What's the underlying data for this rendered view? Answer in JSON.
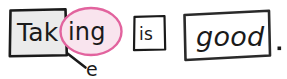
{
  "canvas": {
    "width": 287,
    "height": 78,
    "background": "#ffffff",
    "ink_color": "#1a1a1a"
  },
  "sentence": {
    "full_text": "Taking is good.",
    "terminal_punctuation": "."
  },
  "boxes": [
    {
      "id": "stem-box",
      "name": "verb-stem-box",
      "text": "Tak",
      "fill": "#ebebeb",
      "stroke": "#1a1a1a",
      "shape": "rectangle"
    },
    {
      "id": "copula-box",
      "name": "copula-box",
      "text": "is",
      "fill": "#ffffff",
      "stroke": "#1a1a1a",
      "shape": "rectangle"
    },
    {
      "id": "predicate-box",
      "name": "predicate-box",
      "text": "good",
      "fill": "#ffffff",
      "stroke": "#2a2a2a",
      "shape": "rectangle-tilted"
    }
  ],
  "ellipse": {
    "id": "suffix-ellipse",
    "name": "suffix-ellipse",
    "text": "ing",
    "fill": "#f9e4ee",
    "stroke": "#e2639e",
    "shape": "ellipse"
  },
  "annotation": {
    "id": "dropped-letter",
    "name": "dropped-letter-annotation",
    "text": "e",
    "leader_line": true,
    "ink_color": "#1a1a1a"
  },
  "labels": {
    "stem": "Tak",
    "suffix": "ing",
    "copula": "is",
    "predicate": "good",
    "dropped": "e",
    "period": "."
  }
}
